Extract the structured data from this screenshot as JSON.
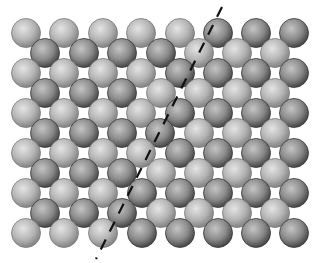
{
  "diagram": {
    "width": 315,
    "height": 263,
    "sphere_radius": 14.5,
    "colors": {
      "background": "#ffffff",
      "light_sphere_highlight": "#e4e4e4",
      "light_sphere_mid": "#b5b5b5",
      "light_sphere_edge": "#7a7a7a",
      "dark_sphere_highlight": "#c4c4c4",
      "dark_sphere_mid": "#8a8a8a",
      "dark_sphere_edge": "#3a3a3a",
      "boundary_line": "#111111"
    },
    "boundary_line": {
      "x1": 222,
      "y1": 7,
      "x2": 96,
      "y2": 259,
      "style": "dashed"
    },
    "rows": [
      {
        "y": 33,
        "light": [
          26,
          64,
          103,
          141,
          180
        ],
        "dark": [
          218,
          256,
          294
        ]
      },
      {
        "y": 53,
        "light": [
          199,
          237,
          275
        ],
        "dark": [
          45,
          84,
          122,
          161
        ]
      },
      {
        "y": 73,
        "light": [
          26,
          64,
          103,
          141
        ],
        "dark": [
          180,
          218,
          256,
          294
        ]
      },
      {
        "y": 93,
        "light": [
          161,
          199,
          237,
          275
        ],
        "dark": [
          45,
          84,
          122
        ]
      },
      {
        "y": 113,
        "light": [
          26,
          64,
          103,
          141
        ],
        "dark": [
          180,
          218,
          256,
          294
        ]
      },
      {
        "y": 133,
        "light": [
          199,
          237,
          275
        ],
        "dark": [
          45,
          84,
          122,
          160
        ]
      },
      {
        "y": 153,
        "light": [
          26,
          64,
          103,
          141
        ],
        "dark": [
          180,
          218,
          256,
          294
        ]
      },
      {
        "y": 173,
        "light": [
          161,
          199,
          237,
          275
        ],
        "dark": [
          45,
          84,
          122
        ]
      },
      {
        "y": 193,
        "light": [
          26,
          64,
          103
        ],
        "dark": [
          142,
          180,
          218,
          256,
          294
        ]
      },
      {
        "y": 213,
        "light": [
          161,
          199,
          237,
          275
        ],
        "dark": [
          45,
          84,
          122
        ]
      },
      {
        "y": 233,
        "light": [
          26,
          64,
          103
        ],
        "dark": [
          142,
          180,
          218,
          256,
          294
        ]
      }
    ]
  }
}
